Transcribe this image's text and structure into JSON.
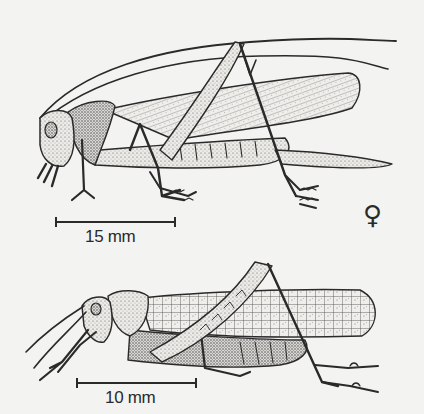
{
  "figure": {
    "specimens": [
      {
        "id": "upper",
        "description": "long-winged bush-cricket with very long antennae and ovipositor, lateral view",
        "scale_bar_label": "15 mm",
        "sex_symbol": "♀",
        "sex": "female"
      },
      {
        "id": "lower",
        "description": "grasshopper with short antennae and reticulate forewing, lateral view",
        "scale_bar_label": "10 mm"
      }
    ],
    "colors": {
      "background": "#f3f3f1",
      "ink": "#2a2a2a",
      "stipple": "#5a5a5a"
    }
  }
}
